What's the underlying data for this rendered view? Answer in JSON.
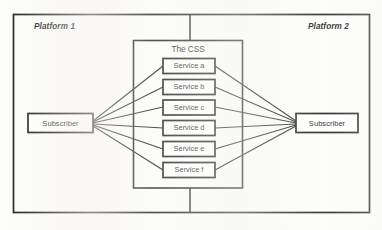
{
  "diagram": {
    "platforms": [
      {
        "id": "platform-1",
        "label": "Platform 1"
      },
      {
        "id": "platform-2",
        "label": "Platform 2"
      }
    ],
    "css_container": {
      "label": "The CSS",
      "services": [
        {
          "id": "service-a",
          "label": "Service a"
        },
        {
          "id": "service-b",
          "label": "Service b"
        },
        {
          "id": "service-c",
          "label": "Service c"
        },
        {
          "id": "service-d",
          "label": "Service d"
        },
        {
          "id": "service-e",
          "label": "Service e"
        },
        {
          "id": "service-f",
          "label": "Service f"
        }
      ]
    },
    "subscribers": [
      {
        "id": "subscriber-left",
        "label": "Subscriber"
      },
      {
        "id": "subscriber-right",
        "label": "Subscriber"
      }
    ],
    "colors": {
      "line": "#1a1a1a",
      "box_fill": "#ffffff",
      "background": "#fdfdfc"
    }
  }
}
